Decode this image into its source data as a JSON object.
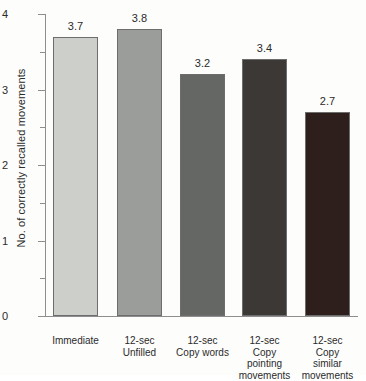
{
  "chart_data": {
    "type": "bar",
    "title": "",
    "subtitle": "",
    "xlabel": "",
    "ylabel": "No. of correctly recalled movements",
    "ylim": [
      0,
      4
    ],
    "ytick_labels": [
      "0",
      "1",
      "2",
      "3",
      "4"
    ],
    "ytick_values": [
      0,
      1,
      2,
      3,
      4
    ],
    "yminor_values": [
      0.5,
      1.5,
      2.5,
      3.5
    ],
    "grid": false,
    "legend": "none",
    "categories": [
      "Immediate",
      "12-sec\nUnfilled",
      "12-sec\nCopy words",
      "12-sec\nCopy\npointing\nmovements",
      "12-sec\nCopy\nsimilar\nmovements"
    ],
    "values": [
      3.7,
      3.8,
      3.2,
      3.4,
      2.7
    ],
    "value_labels": [
      "3.7",
      "3.8",
      "3.2",
      "3.4",
      "2.7"
    ],
    "bar_colors": [
      "#cdcfca",
      "#9b9d9a",
      "#656765",
      "#3c3836",
      "#2e1f1c"
    ],
    "bar_border_color": "#6d6d6d",
    "axis_color": "#8e8e8e"
  }
}
